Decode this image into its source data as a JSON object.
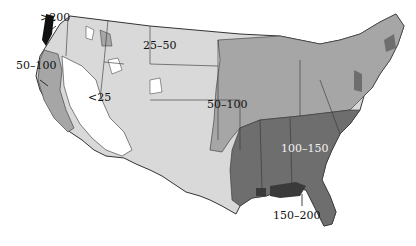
{
  "map": {
    "type": "choropleth",
    "region": "United States (contiguous)",
    "legend_classes": [
      "<25",
      "25-50",
      "50-100",
      "100-150",
      "150-200",
      ">200"
    ],
    "colors": {
      "lt25": "#ffffff",
      "c25_50": "#d9d9d9",
      "c50_100": "#a6a6a6",
      "c100_150": "#6e6e6e",
      "c150_200": "#3a3a3a",
      "gt200": "#111111",
      "border": "#333333"
    },
    "labels": {
      "gt200": ">200",
      "pnw_50_100": "50–100",
      "lt25": "<25",
      "north_25_50": "25–50",
      "central_50_100": "50–100",
      "southeast_100_150": "100–150",
      "gulf_150_200": "150–200"
    }
  }
}
